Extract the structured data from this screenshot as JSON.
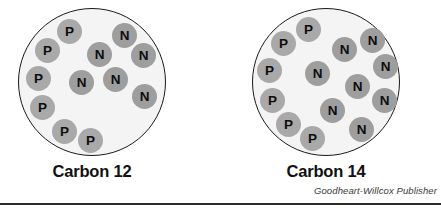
{
  "figure": {
    "background_color": "#ffffff",
    "shell_fill": "#f4f4f4",
    "shell_stroke": "#1a1a1a",
    "proton_color": "#a9a9a9",
    "neutron_color": "#9e9e9e",
    "particle_text_color": "#0d0d0d"
  },
  "credit": {
    "text": "Goodheart-Willcox Publisher"
  },
  "nuclei": [
    {
      "id": "carbon-12",
      "label": "Carbon 12",
      "proton_count": 6,
      "neutron_count": 8,
      "particles": [
        {
          "symbol": "P",
          "type": "proton",
          "x": 43,
          "y": 15
        },
        {
          "symbol": "P",
          "type": "proton",
          "x": 21,
          "y": 34
        },
        {
          "symbol": "P",
          "type": "proton",
          "x": 12,
          "y": 62
        },
        {
          "symbol": "P",
          "type": "proton",
          "x": 16,
          "y": 91
        },
        {
          "symbol": "P",
          "type": "proton",
          "x": 38,
          "y": 115
        },
        {
          "symbol": "P",
          "type": "proton",
          "x": 64,
          "y": 124
        },
        {
          "symbol": "N",
          "type": "neutron",
          "x": 98,
          "y": 19
        },
        {
          "symbol": "N",
          "type": "neutron",
          "x": 73,
          "y": 38
        },
        {
          "symbol": "N",
          "type": "neutron",
          "x": 117,
          "y": 39
        },
        {
          "symbol": "N",
          "type": "neutron",
          "x": 55,
          "y": 66
        },
        {
          "symbol": "N",
          "type": "neutron",
          "x": 89,
          "y": 63
        },
        {
          "symbol": "N",
          "type": "neutron",
          "x": 118,
          "y": 80
        }
      ]
    },
    {
      "id": "carbon-14",
      "label": "Carbon 14",
      "proton_count": 6,
      "neutron_count": 8,
      "particles": [
        {
          "symbol": "P",
          "type": "proton",
          "x": 48,
          "y": 13
        },
        {
          "symbol": "P",
          "type": "proton",
          "x": 23,
          "y": 27
        },
        {
          "symbol": "P",
          "type": "proton",
          "x": 9,
          "y": 54
        },
        {
          "symbol": "P",
          "type": "proton",
          "x": 12,
          "y": 84
        },
        {
          "symbol": "P",
          "type": "proton",
          "x": 28,
          "y": 108
        },
        {
          "symbol": "P",
          "type": "proton",
          "x": 52,
          "y": 122
        },
        {
          "symbol": "N",
          "type": "neutron",
          "x": 84,
          "y": 33
        },
        {
          "symbol": "N",
          "type": "neutron",
          "x": 112,
          "y": 24
        },
        {
          "symbol": "N",
          "type": "neutron",
          "x": 125,
          "y": 50
        },
        {
          "symbol": "N",
          "type": "neutron",
          "x": 57,
          "y": 57
        },
        {
          "symbol": "N",
          "type": "neutron",
          "x": 97,
          "y": 70
        },
        {
          "symbol": "N",
          "type": "neutron",
          "x": 124,
          "y": 84
        },
        {
          "symbol": "N",
          "type": "neutron",
          "x": 72,
          "y": 94
        },
        {
          "symbol": "N",
          "type": "neutron",
          "x": 101,
          "y": 113
        }
      ]
    }
  ]
}
